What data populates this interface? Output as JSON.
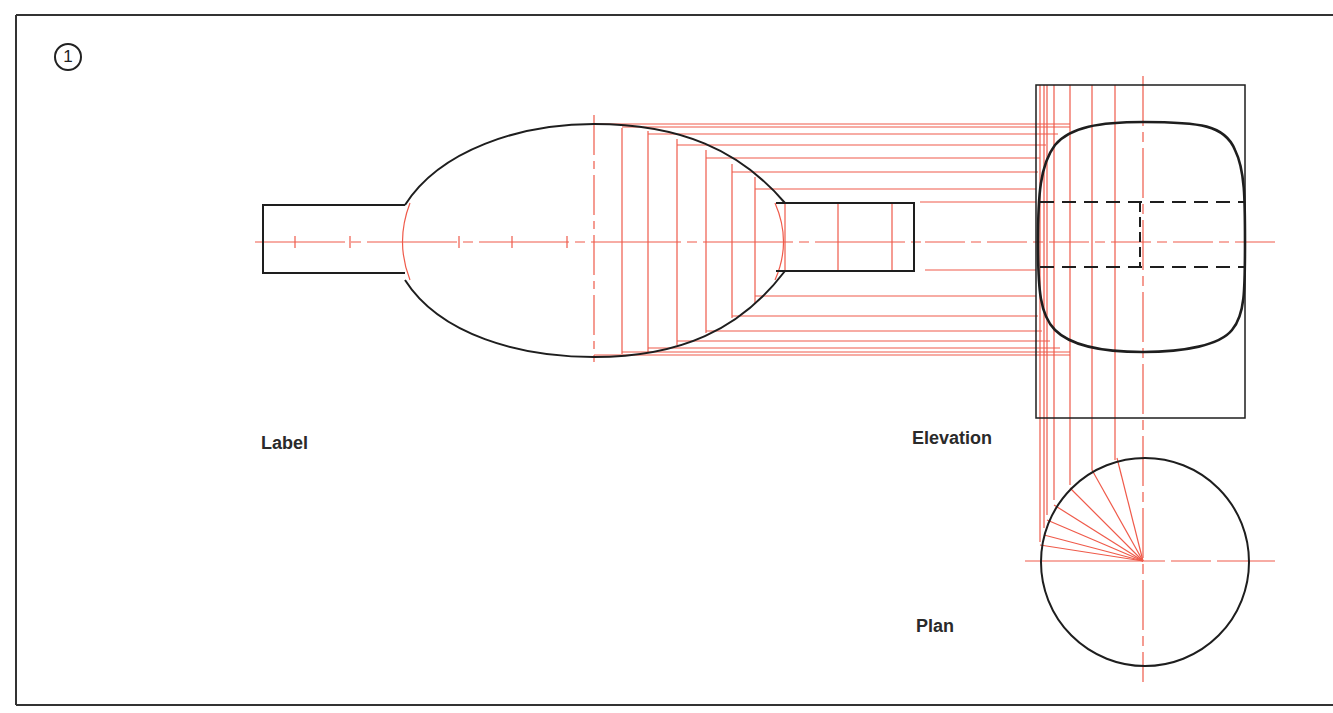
{
  "figure": {
    "step_number": "1",
    "labels": {
      "label_view": "Label",
      "elevation_view": "Elevation",
      "plan_view": "Plan"
    },
    "colors": {
      "outline": "#1e1e1e",
      "construction": "#ef5a4a",
      "background": "#ffffff"
    }
  }
}
